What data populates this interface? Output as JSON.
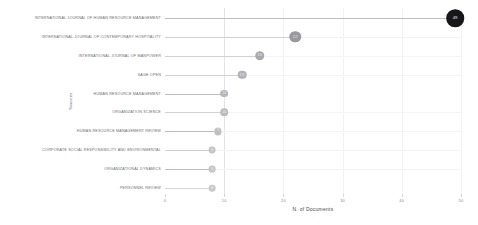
{
  "chart_data": {
    "type": "bar",
    "chart_style": "lollipop",
    "title": "",
    "xlabel": "N. of Documents",
    "ylabel": "Sources",
    "xlim": [
      0,
      50
    ],
    "xticks": [
      0,
      10,
      20,
      30,
      40,
      50
    ],
    "xtick_labels": [
      "0",
      "10",
      "20",
      "30",
      "40",
      "50"
    ],
    "grid": "vertical-faint",
    "legend": "none",
    "orientation": "horizontal",
    "categories": [
      "INTERNATIONAL JOURNAL OF HUMAN RESOURCE MANAGEMENT",
      "INTERNATIONAL JOURNAL OF CONTEMPORARY HOSPITALITY",
      "INTERNATIONAL JOURNAL OF MANPOWER",
      "SAGE OPEN",
      "HUMAN RESOURCE MANAGEMENT",
      "ORGANIZATION SCIENCE",
      "HUMAN RESOURCE MANAGEMENT REVIEW",
      "CORPORATE SOCIAL RESPONSIBILITY AND ENVIRONMENTAL",
      "ORGANIZATIONAL DYNAMICS",
      "PERSONNEL REVIEW"
    ],
    "values": [
      49,
      22,
      16,
      13,
      10,
      10,
      9,
      8,
      8,
      8
    ],
    "value_labels": [
      "49",
      "22",
      "16",
      "13",
      "10",
      "10",
      "9",
      "8",
      "8",
      "8"
    ],
    "marker_colors": [
      "#17171a",
      "#9a9a9e",
      "#a9a9ad",
      "#b2b2b6",
      "#b8b8bc",
      "#bcbcc0",
      "#c0c0c4",
      "#c4c4c8",
      "#c6c6ca",
      "#c8c8cc"
    ],
    "marker_sizes": [
      17.5,
      11.5,
      9.5,
      8.6,
      7.8,
      7.6,
      7.2,
      6.9,
      6.8,
      6.7
    ],
    "stem_color": "#b9b9bc",
    "background": "#ffffff"
  }
}
